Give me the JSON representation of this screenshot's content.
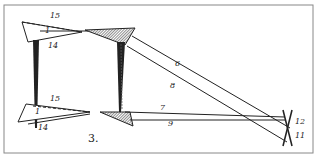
{
  "figure": {
    "number": "3.",
    "labels": {
      "top_15": "15",
      "top_1": "1",
      "top_14": "14",
      "bot_15": "15",
      "bot_1": "1",
      "bot_14": "14",
      "l6": "6",
      "l8": "8",
      "l7": "7",
      "l9": "9",
      "l12": "12",
      "l11": "11"
    },
    "colors": {
      "ink": "#222222",
      "frame": "#888888",
      "paper": "#ffffff"
    }
  }
}
